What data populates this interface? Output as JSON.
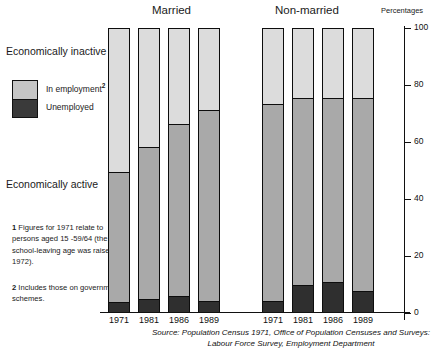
{
  "headers": {
    "married": "Married",
    "non_married": "Non-married",
    "percentages": "Percentages"
  },
  "side_labels": {
    "inactive": "Economically inactive",
    "active": "Economically active"
  },
  "legend": {
    "in_employment": "In employment",
    "in_employment_note": "2",
    "unemployed": "Unemployed"
  },
  "footnotes": {
    "one_num": "1",
    "one_text": " Figures for 1971 relate to persons aged 15 -59/64 (the school-leaving age was raised in 1972).",
    "two_num": "2",
    "two_text": " Includes those on government schemes."
  },
  "source": "Source: Population Census 1971, Office of Population Censuses and Surveys: Labour Force Survey, Employment Department",
  "colors": {
    "inactive": "#dcdcdc",
    "in_employment": "#a9a9a9",
    "unemployed": "#2f2f2f",
    "outline": "#0d0d0d"
  },
  "chart_data": {
    "type": "bar",
    "title": "",
    "subtitle": "",
    "xlabel": "",
    "ylabel": "Percentages",
    "ylim": [
      0,
      100
    ],
    "yticks": [
      0,
      20,
      40,
      60,
      80,
      100
    ],
    "ytick_labels": [
      "0",
      "20",
      "40",
      "60",
      "80",
      "100"
    ],
    "grid": false,
    "legend_position": "left",
    "stacked": true,
    "stack_order_bottom_to_top": [
      "Unemployed",
      "In employment",
      "Economically inactive"
    ],
    "groups": [
      {
        "name": "Married",
        "categories": [
          "1971",
          "1981",
          "1986",
          "1989"
        ],
        "bars": [
          {
            "year": "1971",
            "unemployed": 3.5,
            "in_employment": 45.5,
            "inactive": 51.0
          },
          {
            "year": "1981",
            "unemployed": 4.5,
            "in_employment": 53.5,
            "inactive": 42.0
          },
          {
            "year": "1986",
            "unemployed": 5.5,
            "in_employment": 60.5,
            "inactive": 34.0
          },
          {
            "year": "1989",
            "unemployed": 4.0,
            "in_employment": 67.0,
            "inactive": 29.0
          }
        ]
      },
      {
        "name": "Non-married",
        "categories": [
          "1971",
          "1981",
          "1986",
          "1989"
        ],
        "bars": [
          {
            "year": "1971",
            "unemployed": 4.0,
            "in_employment": 69.0,
            "inactive": 27.0
          },
          {
            "year": "1981",
            "unemployed": 9.5,
            "in_employment": 65.5,
            "inactive": 25.0
          },
          {
            "year": "1986",
            "unemployed": 10.5,
            "in_employment": 64.5,
            "inactive": 25.0
          },
          {
            "year": "1989",
            "unemployed": 7.5,
            "in_employment": 67.5,
            "inactive": 25.0
          }
        ]
      }
    ],
    "series": [
      {
        "name": "Unemployed",
        "values": [
          3.5,
          4.5,
          5.5,
          4.0,
          4.0,
          9.5,
          10.5,
          7.5
        ]
      },
      {
        "name": "In employment",
        "values": [
          45.5,
          53.5,
          60.5,
          67.0,
          69.0,
          65.5,
          64.5,
          67.5
        ]
      },
      {
        "name": "Economically inactive",
        "values": [
          51.0,
          42.0,
          34.0,
          29.0,
          27.0,
          25.0,
          25.0,
          25.0
        ]
      }
    ],
    "x": [
      "1971",
      "1981",
      "1986",
      "1989",
      "1971",
      "1981",
      "1986",
      "1989"
    ]
  }
}
